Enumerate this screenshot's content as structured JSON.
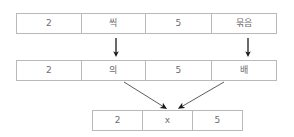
{
  "diagram": {
    "type": "transformation-diagram",
    "rows": [
      {
        "name": "expression-row-1",
        "cells": [
          "2",
          "씩",
          "5",
          "묶음"
        ]
      },
      {
        "name": "expression-row-2",
        "cells": [
          "2",
          "의",
          "5",
          "배"
        ]
      },
      {
        "name": "expression-row-3",
        "cells": [
          "2",
          "x",
          "5"
        ]
      }
    ],
    "arrows": [
      {
        "name": "arrow-down-ssik-to-ui",
        "direction": "down"
      },
      {
        "name": "arrow-down-mukeum-to-bae",
        "direction": "down"
      },
      {
        "name": "arrow-diagonal-ui-to-times",
        "direction": "down-right"
      },
      {
        "name": "arrow-diagonal-bae-to-times",
        "direction": "down-left"
      }
    ],
    "colors": {
      "border": "#b9b9b9",
      "text": "#6d6d6d",
      "arrow": "#1a1a1a",
      "background": "#ffffff"
    }
  }
}
